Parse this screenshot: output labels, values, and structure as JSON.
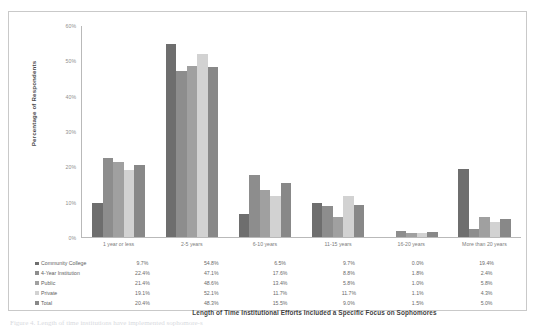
{
  "figure": {
    "caption_fragment": "Figure 4. Length of time institutions have implemented sophomore-s"
  },
  "chart_data": {
    "type": "bar",
    "title": "",
    "xlabel": "Length of Time Institutional Efforts Included a Specific Focus on Sophomores",
    "ylabel": "Percentage of Respondents",
    "ylim": [
      0,
      60
    ],
    "yticks": [
      "0%",
      "10%",
      "20%",
      "30%",
      "40%",
      "50%",
      "60%"
    ],
    "ytick_values": [
      0,
      10,
      20,
      30,
      40,
      50,
      60
    ],
    "grid": false,
    "legend_position": "bottom-table",
    "categories": [
      "1 year or less",
      "2-5 years",
      "6-10 years",
      "11-15 years",
      "16-20 years",
      "More than 20 years"
    ],
    "series": [
      {
        "name": "Community College",
        "color": "#6e6e6e",
        "values": [
          9.7,
          54.8,
          6.5,
          9.7,
          0.0,
          19.4
        ],
        "labels": [
          "9.7%",
          "54.8%",
          "6.5%",
          "9.7%",
          "0.0%",
          "19.4%"
        ]
      },
      {
        "name": "4-Year Institution",
        "color": "#8d8d8d",
        "values": [
          22.4,
          47.1,
          17.6,
          8.8,
          1.8,
          2.4
        ],
        "labels": [
          "22.4%",
          "47.1%",
          "17.6%",
          "8.8%",
          "1.8%",
          "2.4%"
        ]
      },
      {
        "name": "Public",
        "color": "#a0a0a0",
        "values": [
          21.4,
          48.6,
          13.4,
          5.8,
          1.0,
          5.8
        ],
        "labels": [
          "21.4%",
          "48.6%",
          "13.4%",
          "5.8%",
          "1.0%",
          "5.8%"
        ]
      },
      {
        "name": "Private",
        "color": "#d2d2d2",
        "values": [
          19.1,
          52.1,
          11.7,
          11.7,
          1.1,
          4.3
        ],
        "labels": [
          "19.1%",
          "52.1%",
          "11.7%",
          "11.7%",
          "1.1%",
          "4.3%"
        ]
      },
      {
        "name": "Total",
        "color": "#888888",
        "values": [
          20.4,
          48.3,
          15.5,
          9.0,
          1.5,
          5.0
        ],
        "labels": [
          "20.4%",
          "48.3%",
          "15.5%",
          "9.0%",
          "1.5%",
          "5.0%"
        ]
      }
    ]
  }
}
